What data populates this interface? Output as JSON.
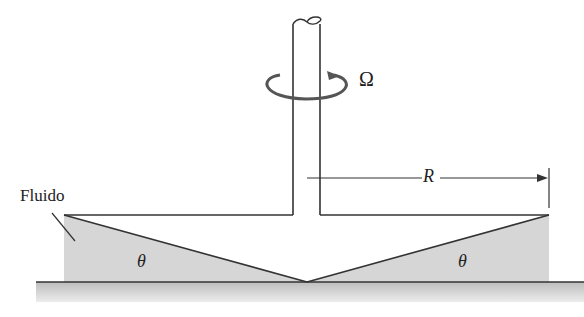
{
  "diagram": {
    "type": "cone-and-plate viscometer",
    "labels": {
      "fluid": "Fluido",
      "omega": "Ω",
      "radius": "R",
      "angle_left": "θ",
      "angle_right": "θ"
    },
    "colors": {
      "line": "#333333",
      "fluid_fill": "#d4d4d4",
      "base_fill": "#c8c8c8",
      "background": "#ffffff"
    }
  }
}
